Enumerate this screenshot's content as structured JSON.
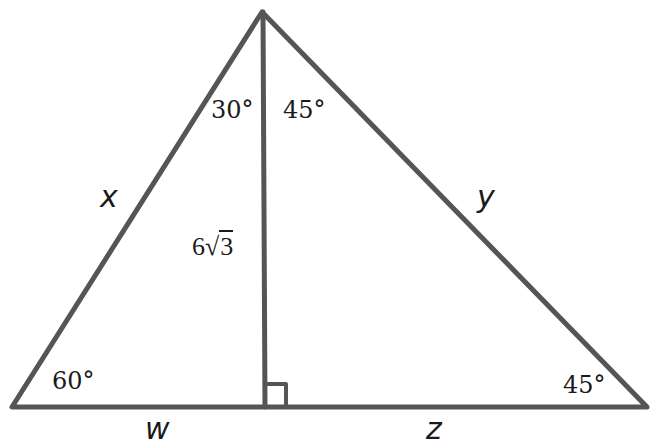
{
  "diagram": {
    "type": "triangle-with-altitude",
    "stroke_color": "#555555",
    "vertices": {
      "apex": [
        262,
        12
      ],
      "bottom_left": [
        12,
        407
      ],
      "bottom_right": [
        647,
        407
      ],
      "altitude_foot": [
        265,
        407
      ]
    },
    "angles": {
      "apex_left": "30°",
      "apex_right": "45°",
      "bottom_left": "60°",
      "bottom_right": "45°",
      "right_angle_marker": true
    },
    "sides": {
      "left": "x",
      "right": "y",
      "base_left": "w",
      "base_right": "z"
    },
    "altitude": {
      "coefficient": "6",
      "radicand": "3"
    }
  }
}
